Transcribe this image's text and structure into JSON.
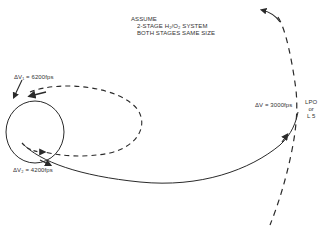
{
  "diagram": {
    "type": "orbital-transfer-trajectory",
    "assumptions": {
      "heading": "ASSUME",
      "line1": "2-STAGE H₂/O₂ SYSTEM",
      "line2": "BOTH STAGES SAME SIZE"
    },
    "burns": {
      "dv1": "ΔV₁ = 6200fps",
      "dv2": "ΔV₂ = 4200fps",
      "dv3": "ΔV = 3000fps"
    },
    "destination": {
      "line1": "LPO",
      "line2": "or",
      "line3": "L 5"
    },
    "elements": [
      {
        "name": "central-body-orbit",
        "style": "solid",
        "shape": "circle"
      },
      {
        "name": "elliptical-transfer-orbit",
        "style": "dashed",
        "shape": "ellipse"
      },
      {
        "name": "transfer-trajectory",
        "style": "solid",
        "shape": "curve"
      },
      {
        "name": "destination-trajectory",
        "style": "dashed",
        "shape": "curve"
      }
    ],
    "colors": {
      "line": "#2a2a2a",
      "background": "#ffffff"
    }
  }
}
